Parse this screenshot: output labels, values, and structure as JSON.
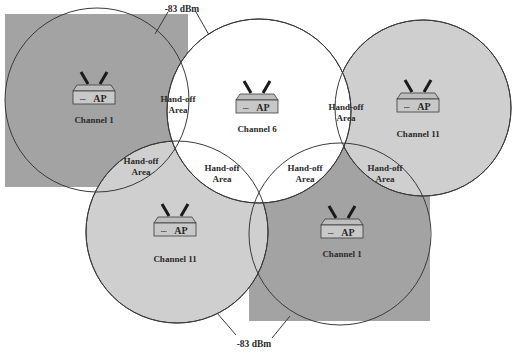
{
  "colors": {
    "square_fill": "#a3a3a3",
    "circle_gray_fill": "#cfcfcf",
    "circle_white_fill": "#ffffff",
    "stroke": "#3a3a3a",
    "ap_fill": "#c4c4c4"
  },
  "signal_labels": {
    "top": "-83 dBm",
    "bottom": "-83 dBm"
  },
  "access_points": [
    {
      "id": "ap-channel-1-top-left",
      "label": "AP",
      "leds": "▪▪▪▪",
      "channel": "Channel 1"
    },
    {
      "id": "ap-channel-6-top-center",
      "label": "AP",
      "leds": "▪▪▪▪",
      "channel": "Channel 6"
    },
    {
      "id": "ap-channel-11-top-right",
      "label": "AP",
      "leds": "▪▪▪▪",
      "channel": "Channel 11"
    },
    {
      "id": "ap-channel-11-bottom-left",
      "label": "AP",
      "leds": "▪▪▪▪",
      "channel": "Channel 11"
    },
    {
      "id": "ap-channel-1-bottom-right",
      "label": "AP",
      "leds": "▪▪▪▪",
      "channel": "Channel 1"
    }
  ],
  "handoff_areas": [
    {
      "line1": "Hand-off",
      "line2": "Area"
    },
    {
      "line1": "Hand-off",
      "line2": "Area"
    },
    {
      "line1": "Hand-off",
      "line2": "Area"
    },
    {
      "line1": "Hand-off",
      "line2": "Area"
    },
    {
      "line1": "Hand-off",
      "line2": "Area"
    },
    {
      "line1": "Hand-off",
      "line2": "Area"
    }
  ]
}
